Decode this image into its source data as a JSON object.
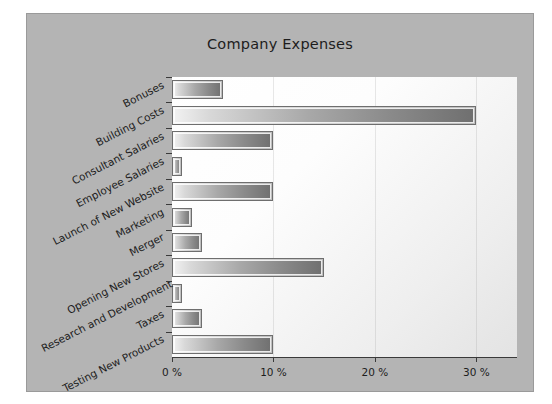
{
  "chart_data": {
    "type": "bar",
    "orientation": "horizontal",
    "title": "Company Expenses",
    "xlabel": "",
    "ylabel": "",
    "categories": [
      "Bonuses",
      "Building Costs",
      "Consultant Salaries",
      "Employee Salaries",
      "Launch of New Website",
      "Marketing",
      "Merger",
      "Opening New Stores",
      "Research and Development",
      "Taxes",
      "Testing New Products"
    ],
    "values": [
      5,
      30,
      10,
      1,
      10,
      2,
      3,
      15,
      1,
      3,
      10
    ],
    "value_unit": "%",
    "xlim": [
      0,
      34
    ],
    "xticks": [
      0,
      10,
      20,
      30
    ],
    "xtick_labels": [
      "0 %",
      "10 %",
      "20 %",
      "30 %"
    ],
    "grid": false,
    "legend": "none",
    "series": [
      {
        "name": "Expenses",
        "values": [
          5,
          30,
          10,
          1,
          10,
          2,
          3,
          15,
          1,
          3,
          10
        ]
      }
    ]
  },
  "style": {
    "frame_bg": "#b4b4b4",
    "plot_bg": "#ffffff",
    "bar_fill_light": "#f2f2f2",
    "bar_fill_dark": "#6f6f6f",
    "bar_border": "#6e6e6e",
    "axis_color": "#3a3a3a",
    "text_color": "#1d1d1d"
  }
}
